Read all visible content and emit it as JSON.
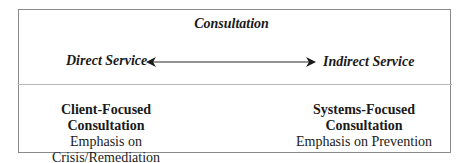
{
  "diagram": {
    "title": "Consultation",
    "continuum": {
      "left_label": "Direct Service",
      "right_label": "Indirect Service",
      "connector": "double-headed-arrow"
    },
    "columns": [
      {
        "heading": "Client-Focused Consultation",
        "subheading": "Emphasis on Crisis/Remediation"
      },
      {
        "heading": "Systems-Focused Consultation",
        "subheading": "Emphasis on Prevention"
      }
    ],
    "colors": {
      "border": "#8a8a8a",
      "divider": "#b8b8b8",
      "text": "#1a1a1a"
    }
  }
}
